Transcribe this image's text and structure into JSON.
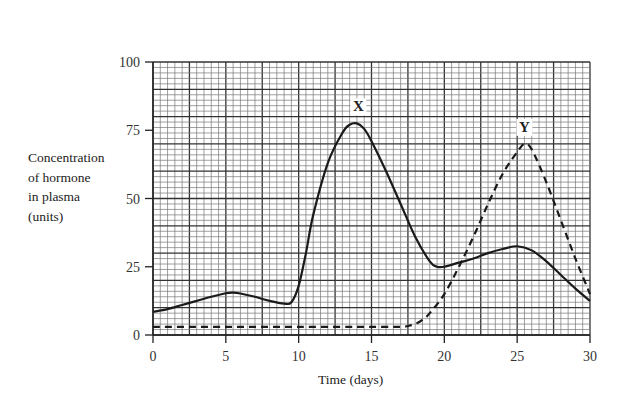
{
  "chart_data": {
    "type": "line",
    "title": "",
    "xlabel": "Time (days)",
    "ylabel": "Concentration of hormone in plasma (units)",
    "ylabel_lines": [
      "Concentration",
      "of hormone",
      "in plasma",
      "(units)"
    ],
    "xlim": [
      0,
      30
    ],
    "ylim": [
      0,
      100
    ],
    "xticks": [
      0,
      5,
      10,
      15,
      20,
      25,
      30
    ],
    "yticks": [
      0,
      25,
      50,
      75,
      100
    ],
    "grid": true,
    "series": [
      {
        "name": "X",
        "style": "solid",
        "x": [
          0,
          1,
          2,
          3,
          4,
          5,
          5.5,
          6,
          7,
          8,
          9,
          9.5,
          10,
          10.5,
          11,
          12,
          13,
          13.5,
          14,
          14.5,
          15,
          16,
          17,
          18,
          19,
          19.5,
          20,
          21,
          22,
          23,
          24,
          25,
          26,
          27,
          28,
          29,
          30
        ],
        "y": [
          8.5,
          9.5,
          11,
          12.5,
          14,
          15.3,
          15.5,
          15.2,
          14,
          12.5,
          11.5,
          12,
          18,
          30,
          44,
          63,
          74,
          77,
          77.5,
          75.5,
          71,
          60,
          48,
          36,
          27,
          25,
          25,
          26.5,
          28,
          30,
          31.5,
          32.5,
          31,
          27,
          22,
          17,
          12.5
        ],
        "peak_label": {
          "text": "X",
          "x": 14.1,
          "y": 77.5
        }
      },
      {
        "name": "Y",
        "style": "dashed",
        "x": [
          0,
          5,
          10,
          15,
          17,
          17.5,
          18,
          18.5,
          19,
          20,
          21,
          22,
          23,
          24,
          25,
          25.5,
          26,
          27,
          28,
          29,
          30
        ],
        "y": [
          3,
          3,
          3,
          3,
          3,
          3.3,
          4,
          5.5,
          8,
          15,
          25,
          36,
          48,
          59,
          67,
          70,
          68,
          56,
          42,
          28,
          15
        ],
        "peak_label": {
          "text": "Y",
          "x": 25.5,
          "y": 70
        }
      }
    ]
  }
}
